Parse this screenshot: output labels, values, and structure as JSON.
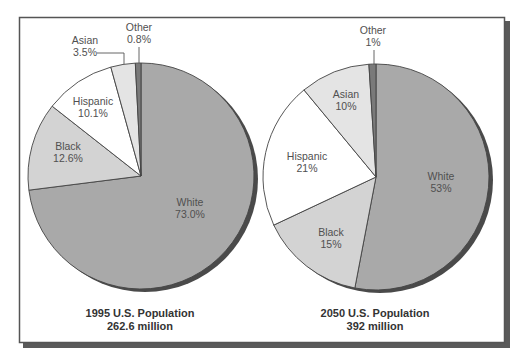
{
  "chart_data": [
    {
      "type": "pie",
      "title": "1995 U.S. Population",
      "subtitle": "262.6 million",
      "start": "top",
      "direction": "clockwise",
      "slices": [
        {
          "name": "White",
          "value": 73.0,
          "label": "White",
          "value_label": "73.0%",
          "color": "#a9a9a9"
        },
        {
          "name": "Black",
          "value": 12.6,
          "label": "Black",
          "value_label": "12.6%",
          "color": "#d3d3d3"
        },
        {
          "name": "Hispanic",
          "value": 10.1,
          "label": "Hispanic",
          "value_label": "10.1%",
          "color": "#ffffff"
        },
        {
          "name": "Asian",
          "value": 3.5,
          "label": "Asian",
          "value_label": "3.5%",
          "color": "#e4e4e4"
        },
        {
          "name": "Other",
          "value": 0.8,
          "label": "Other",
          "value_label": "0.8%",
          "color": "#7a7a7a"
        }
      ]
    },
    {
      "type": "pie",
      "title": "2050 U.S. Population",
      "subtitle": "392 million",
      "start": "top",
      "direction": "clockwise",
      "slices": [
        {
          "name": "White",
          "value": 53,
          "label": "White",
          "value_label": "53%",
          "color": "#a9a9a9"
        },
        {
          "name": "Black",
          "value": 15,
          "label": "Black",
          "value_label": "15%",
          "color": "#d3d3d3"
        },
        {
          "name": "Hispanic",
          "value": 21,
          "label": "Hispanic",
          "value_label": "21%",
          "color": "#ffffff"
        },
        {
          "name": "Asian",
          "value": 10,
          "label": "Asian",
          "value_label": "10%",
          "color": "#e4e4e4"
        },
        {
          "name": "Other",
          "value": 1,
          "label": "Other",
          "value_label": "1%",
          "color": "#7a7a7a"
        }
      ]
    }
  ],
  "colors": {
    "frame": "#555555",
    "shadow": "#4a4a4a",
    "outline": "#444444",
    "label_text": "#505050",
    "caption_text": "#333333"
  }
}
